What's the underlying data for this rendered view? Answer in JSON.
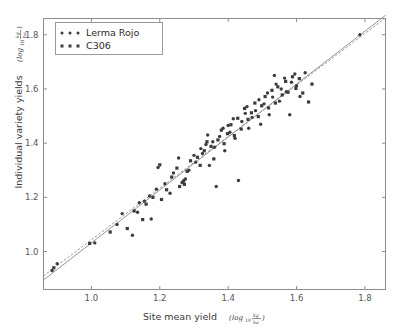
{
  "chart_data": {
    "type": "scatter",
    "title": "",
    "xlabel": "Site mean yield",
    "xlabel_units": "log",
    "xlabel_units_sub": "10",
    "xlabel_frac_num": "kg",
    "xlabel_frac_den": "ha",
    "ylabel": "Individual variety yields",
    "ylabel_units": "log",
    "ylabel_units_sub": "10",
    "ylabel_frac_num": "kg",
    "ylabel_frac_den": "ha",
    "xlim": [
      0.86,
      1.86
    ],
    "ylim": [
      0.86,
      1.86
    ],
    "xticks": [
      1.0,
      1.2,
      1.4,
      1.6,
      1.8
    ],
    "xtick_labels": [
      "1.0",
      "1.2",
      "1.4",
      "1.6",
      "1.8"
    ],
    "yticks": [
      1.0,
      1.2,
      1.4,
      1.6,
      1.8
    ],
    "ytick_labels": [
      "1.0",
      "1.2",
      "1.4",
      "1.6",
      "1.8"
    ],
    "grid": false,
    "legend_position": "upper-left",
    "marker_color": "#3c3c3c",
    "line_color": "#8a8a8a",
    "series": [
      {
        "name": "Lerma Rojo",
        "marker": "circle",
        "color": "#3c3c3c",
        "points": [
          [
            0.885,
            0.93
          ],
          [
            0.9,
            0.955
          ],
          [
            1.01,
            1.032
          ],
          [
            1.075,
            1.1
          ],
          [
            1.09,
            1.14
          ],
          [
            1.12,
            1.06
          ],
          [
            1.135,
            1.145
          ],
          [
            1.14,
            1.18
          ],
          [
            1.155,
            1.186
          ],
          [
            1.17,
            1.205
          ],
          [
            1.175,
            1.12
          ],
          [
            1.19,
            1.23
          ],
          [
            1.195,
            1.31
          ],
          [
            1.215,
            1.25
          ],
          [
            1.23,
            1.215
          ],
          [
            1.24,
            1.29
          ],
          [
            1.255,
            1.345
          ],
          [
            1.265,
            1.255
          ],
          [
            1.27,
            1.262
          ],
          [
            1.275,
            1.268
          ],
          [
            1.285,
            1.3
          ],
          [
            1.3,
            1.355
          ],
          [
            1.305,
            1.33
          ],
          [
            1.32,
            1.38
          ],
          [
            1.325,
            1.362
          ],
          [
            1.335,
            1.395
          ],
          [
            1.34,
            1.43
          ],
          [
            1.345,
            1.318
          ],
          [
            1.355,
            1.405
          ],
          [
            1.36,
            1.385
          ],
          [
            1.365,
            1.24
          ],
          [
            1.375,
            1.425
          ],
          [
            1.385,
            1.455
          ],
          [
            1.39,
            1.372
          ],
          [
            1.4,
            1.465
          ],
          [
            1.405,
            1.44
          ],
          [
            1.415,
            1.49
          ],
          [
            1.42,
            1.418
          ],
          [
            1.43,
            1.262
          ],
          [
            1.44,
            1.48
          ],
          [
            1.45,
            1.51
          ],
          [
            1.455,
            1.535
          ],
          [
            1.46,
            1.455
          ],
          [
            1.47,
            1.495
          ],
          [
            1.48,
            1.52
          ],
          [
            1.49,
            1.56
          ],
          [
            1.495,
            1.47
          ],
          [
            1.505,
            1.545
          ],
          [
            1.515,
            1.585
          ],
          [
            1.52,
            1.505
          ],
          [
            1.53,
            1.57
          ],
          [
            1.535,
            1.65
          ],
          [
            1.54,
            1.618
          ],
          [
            1.55,
            1.555
          ],
          [
            1.555,
            1.6
          ],
          [
            1.565,
            1.64
          ],
          [
            1.57,
            1.59
          ],
          [
            1.58,
            1.505
          ],
          [
            1.585,
            1.625
          ],
          [
            1.595,
            1.655
          ],
          [
            1.6,
            1.612
          ],
          [
            1.61,
            1.572
          ],
          [
            1.625,
            1.66
          ],
          [
            1.785,
            1.8
          ]
        ]
      },
      {
        "name": "C306",
        "marker": "square",
        "color": "#3c3c3c",
        "points": [
          [
            0.89,
            0.94
          ],
          [
            0.995,
            1.03
          ],
          [
            1.055,
            1.072
          ],
          [
            1.105,
            1.085
          ],
          [
            1.125,
            1.15
          ],
          [
            1.15,
            1.118
          ],
          [
            1.16,
            1.175
          ],
          [
            1.18,
            1.2
          ],
          [
            1.2,
            1.32
          ],
          [
            1.205,
            1.192
          ],
          [
            1.22,
            1.228
          ],
          [
            1.235,
            1.275
          ],
          [
            1.25,
            1.308
          ],
          [
            1.258,
            1.24
          ],
          [
            1.268,
            1.255
          ],
          [
            1.272,
            1.248
          ],
          [
            1.28,
            1.296
          ],
          [
            1.29,
            1.335
          ],
          [
            1.31,
            1.348
          ],
          [
            1.318,
            1.318
          ],
          [
            1.33,
            1.372
          ],
          [
            1.338,
            1.405
          ],
          [
            1.35,
            1.388
          ],
          [
            1.358,
            1.342
          ],
          [
            1.37,
            1.412
          ],
          [
            1.38,
            1.448
          ],
          [
            1.388,
            1.398
          ],
          [
            1.398,
            1.435
          ],
          [
            1.408,
            1.468
          ],
          [
            1.418,
            1.428
          ],
          [
            1.428,
            1.492
          ],
          [
            1.438,
            1.452
          ],
          [
            1.448,
            1.528
          ],
          [
            1.458,
            1.488
          ],
          [
            1.468,
            1.512
          ],
          [
            1.478,
            1.548
          ],
          [
            1.488,
            1.498
          ],
          [
            1.498,
            1.538
          ],
          [
            1.508,
            1.572
          ],
          [
            1.518,
            1.53
          ],
          [
            1.528,
            1.595
          ],
          [
            1.538,
            1.548
          ],
          [
            1.545,
            1.608
          ],
          [
            1.558,
            1.578
          ],
          [
            1.568,
            1.628
          ],
          [
            1.575,
            1.588
          ],
          [
            1.588,
            1.645
          ],
          [
            1.598,
            1.602
          ],
          [
            1.608,
            1.638
          ],
          [
            1.618,
            1.585
          ],
          [
            1.635,
            1.552
          ],
          [
            1.645,
            1.618
          ]
        ]
      }
    ],
    "fit_lines": [
      {
        "name": "Lerma Rojo fit",
        "style": "solid",
        "color": "#8a8a8a",
        "x0": 0.86,
        "y0": 0.895,
        "x1": 1.86,
        "y1": 1.872
      },
      {
        "name": "C306 fit",
        "style": "dashed",
        "color": "#8a8a8a",
        "x0": 0.86,
        "y0": 0.91,
        "x1": 1.86,
        "y1": 1.862
      }
    ]
  },
  "legend": {
    "entries": [
      {
        "label": "Lerma Rojo",
        "marker": "circle"
      },
      {
        "label": "C306",
        "marker": "square"
      }
    ]
  }
}
